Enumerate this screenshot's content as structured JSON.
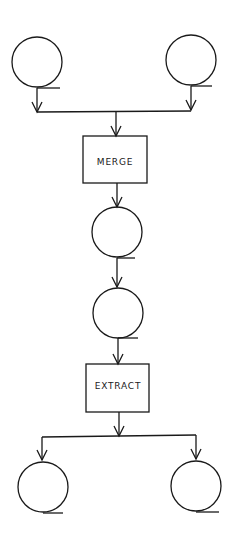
{
  "diagram": {
    "type": "flowchart",
    "nodes": [
      {
        "id": "input-1",
        "shape": "circle",
        "label": ""
      },
      {
        "id": "input-2",
        "shape": "circle",
        "label": ""
      },
      {
        "id": "merge",
        "shape": "rectangle",
        "label": "MERGE"
      },
      {
        "id": "intermediate-1",
        "shape": "circle",
        "label": ""
      },
      {
        "id": "intermediate-2",
        "shape": "circle",
        "label": ""
      },
      {
        "id": "extract",
        "shape": "rectangle",
        "label": "EXTRACT"
      },
      {
        "id": "output-1",
        "shape": "circle",
        "label": ""
      },
      {
        "id": "output-2",
        "shape": "circle",
        "label": ""
      }
    ],
    "edges": [
      {
        "from": "input-1",
        "to": "merge"
      },
      {
        "from": "input-2",
        "to": "merge"
      },
      {
        "from": "merge",
        "to": "intermediate-1"
      },
      {
        "from": "intermediate-1",
        "to": "intermediate-2"
      },
      {
        "from": "intermediate-2",
        "to": "extract"
      },
      {
        "from": "extract",
        "to": "output-1"
      },
      {
        "from": "extract",
        "to": "output-2"
      }
    ]
  },
  "labels": {
    "merge": "MERGE",
    "extract": "EXTRACT"
  },
  "colors": {
    "stroke": "#1a1a1a",
    "background": "#ffffff"
  }
}
